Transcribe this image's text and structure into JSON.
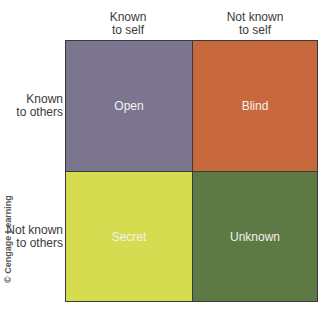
{
  "columns": [
    {
      "label_line1": "Known",
      "label_line2": "to self"
    },
    {
      "label_line1": "Not known",
      "label_line2": "to self"
    }
  ],
  "rows": [
    {
      "label_line1": "Known",
      "label_line2": "to others"
    },
    {
      "label_line1": "Not known",
      "label_line2": "to others"
    }
  ],
  "quadrants": [
    {
      "label": "Open",
      "color": "#7b7590"
    },
    {
      "label": "Blind",
      "color": "#c8683d"
    },
    {
      "label": "Secret",
      "color": "#d5dc50"
    },
    {
      "label": "Unknown",
      "color": "#5e7a44"
    }
  ],
  "credit": "© Cengage Learning"
}
